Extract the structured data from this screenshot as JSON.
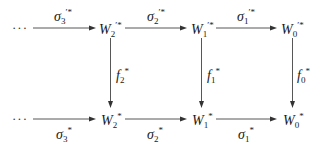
{
  "diagram": {
    "type": "commutative-diagram",
    "top_row": {
      "leading_ellipsis": "···",
      "nodes": [
        {
          "id": "W2p",
          "base": "W",
          "sub": "2",
          "sup": "′*"
        },
        {
          "id": "W1p",
          "base": "W",
          "sub": "1",
          "sup": "′*"
        },
        {
          "id": "W0p",
          "base": "W",
          "sub": "0",
          "sup": "′*"
        }
      ],
      "arrows": [
        {
          "from": "···",
          "to": "W2p",
          "base": "σ",
          "sub": "3",
          "sup": "′*"
        },
        {
          "from": "W2p",
          "to": "W1p",
          "base": "σ",
          "sub": "2",
          "sup": "′*"
        },
        {
          "from": "W1p",
          "to": "W0p",
          "base": "σ",
          "sub": "1",
          "sup": "′*"
        }
      ]
    },
    "bottom_row": {
      "leading_ellipsis": "···",
      "nodes": [
        {
          "id": "W2",
          "base": "W",
          "sub": "2",
          "sup": "*"
        },
        {
          "id": "W1",
          "base": "W",
          "sub": "1",
          "sup": "*"
        },
        {
          "id": "W0",
          "base": "W",
          "sub": "0",
          "sup": "*"
        }
      ],
      "arrows": [
        {
          "from": "···",
          "to": "W2",
          "base": "σ",
          "sub": "3",
          "sup": "*"
        },
        {
          "from": "W2",
          "to": "W1",
          "base": "σ",
          "sub": "2",
          "sup": "*"
        },
        {
          "from": "W1",
          "to": "W0",
          "base": "σ",
          "sub": "1",
          "sup": "*"
        }
      ]
    },
    "vertical_arrows": [
      {
        "from": "W2p",
        "to": "W2",
        "base": "f",
        "sub": "2",
        "sup": "*"
      },
      {
        "from": "W1p",
        "to": "W1",
        "base": "f",
        "sub": "1",
        "sup": "*"
      },
      {
        "from": "W0p",
        "to": "W0",
        "base": "f",
        "sub": "0",
        "sup": "*"
      }
    ]
  }
}
